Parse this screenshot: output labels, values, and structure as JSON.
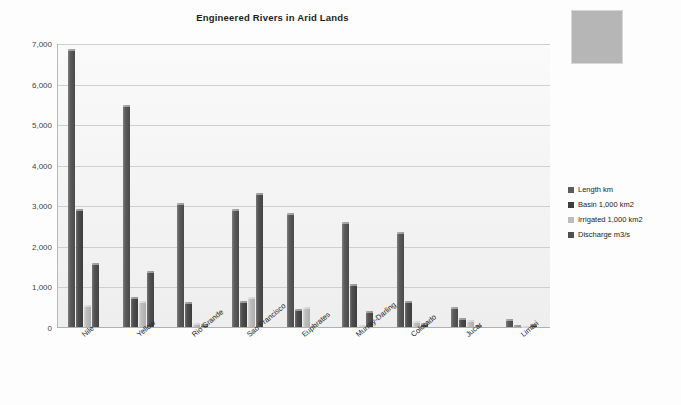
{
  "chart_data": {
    "type": "bar",
    "title": "Engineered Rivers in Arid Lands",
    "xlabel": "",
    "ylabel": "",
    "ylim": [
      0,
      7000
    ],
    "ytick_step": 1000,
    "ytick_labels": [
      "0",
      "1,000",
      "2,000",
      "3,000",
      "4,000",
      "5,000",
      "6,000",
      "7,000"
    ],
    "grid": true,
    "legend_position": "right",
    "categories": [
      "Nile",
      "Yellow",
      "Rio Grande",
      "Sao Francisco",
      "Euphrates",
      "Murray-Darling",
      "Colorado",
      "Jucar",
      "Limari"
    ],
    "series": [
      {
        "name": "Length km",
        "color": "#5b5b5b",
        "values": [
          6850,
          5460,
          3060,
          2910,
          2800,
          2590,
          2330,
          500,
          200
        ]
      },
      {
        "name": "Basin 1,000 km2",
        "color": "#3d3d3d",
        "values": [
          2900,
          750,
          610,
          640,
          440,
          1060,
          640,
          220,
          60
        ]
      },
      {
        "name": "Irrigated 1,000 km2",
        "color": "#bdbdbd",
        "values": [
          550,
          640,
          100,
          730,
          500,
          60,
          160,
          180,
          20
        ]
      },
      {
        "name": "Discharge m3/s",
        "color": "#4f4f4f",
        "values": [
          1580,
          1370,
          82,
          3300,
          30,
          390,
          100,
          50,
          80
        ]
      }
    ]
  },
  "placeholder": {
    "label": ""
  }
}
